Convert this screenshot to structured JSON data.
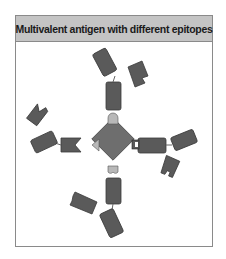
{
  "figure": {
    "title": "Multivalent antigen with different epitopes"
  },
  "colors": {
    "antibody": "#5a5a5a",
    "antigen_core": "#6e6e6e",
    "epitope": "#b8b8b8",
    "header_bg": "#c4c4c4",
    "frame": "#8a8a8a"
  },
  "elements": {
    "antigen": "multivalent antigen (diamond core)",
    "epitopes": [
      "top rounded epitope",
      "left triangular epitope",
      "right square epitope",
      "bottom double-bump epitope"
    ],
    "antibodies": [
      "top antibody",
      "left antibody",
      "right antibody",
      "bottom antibody"
    ]
  }
}
